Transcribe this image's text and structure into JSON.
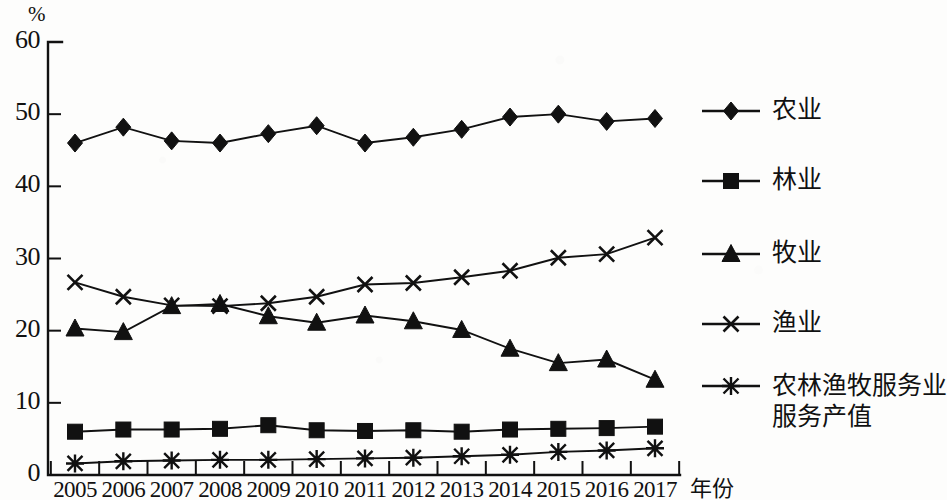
{
  "chart_data": {
    "type": "line",
    "title": "",
    "subtitle": "",
    "xlabel": "年份",
    "ylabel": "%",
    "unit_label": "%",
    "categories": [
      "2005",
      "2006",
      "2007",
      "2008",
      "2009",
      "2010",
      "2011",
      "2012",
      "2013",
      "2014",
      "2015",
      "2016",
      "2017"
    ],
    "x": [
      2005,
      2006,
      2007,
      2008,
      2009,
      2010,
      2011,
      2012,
      2013,
      2014,
      2015,
      2016,
      2017
    ],
    "ylim": [
      0,
      60
    ],
    "yticks": [
      0,
      10,
      20,
      30,
      40,
      50,
      60
    ],
    "ytick_labels": [
      "0",
      "10",
      "20",
      "30",
      "40",
      "50",
      "60"
    ],
    "grid": false,
    "legend_position": "right",
    "series": [
      {
        "name": "农业",
        "marker": "diamond",
        "values": [
          46.0,
          48.2,
          46.3,
          46.0,
          47.3,
          48.4,
          46.0,
          46.8,
          47.9,
          49.6,
          50.0,
          49.0,
          49.4
        ]
      },
      {
        "name": "林业",
        "marker": "square",
        "values": [
          6.0,
          6.3,
          6.3,
          6.4,
          6.9,
          6.2,
          6.1,
          6.2,
          6.0,
          6.3,
          6.4,
          6.5,
          6.7
        ]
      },
      {
        "name": "牧业",
        "marker": "triangle",
        "values": [
          20.3,
          19.8,
          23.4,
          23.7,
          22.0,
          21.1,
          22.1,
          21.3,
          20.1,
          17.5,
          15.5,
          16.0,
          13.2
        ]
      },
      {
        "name": "渔业",
        "marker": "x",
        "values": [
          26.7,
          24.7,
          23.5,
          23.4,
          23.8,
          24.7,
          26.4,
          26.6,
          27.4,
          28.3,
          30.1,
          30.6,
          32.9
        ]
      },
      {
        "name": "农林渔牧服务业服务产值",
        "marker": "star",
        "values": [
          1.6,
          1.9,
          2.0,
          2.1,
          2.1,
          2.2,
          2.3,
          2.4,
          2.6,
          2.8,
          3.2,
          3.4,
          3.7
        ]
      }
    ],
    "colors": {
      "series": "#111111",
      "axis": "#111111",
      "background": "#fdfdfc"
    }
  },
  "legend": {
    "items": [
      {
        "label": "农业",
        "marker": "diamond"
      },
      {
        "label": "林业",
        "marker": "square"
      },
      {
        "label": "牧业",
        "marker": "triangle"
      },
      {
        "label": "渔业",
        "marker": "x"
      },
      {
        "label": "农林渔牧服务业",
        "label_line2": "服务产值",
        "marker": "star"
      }
    ]
  }
}
